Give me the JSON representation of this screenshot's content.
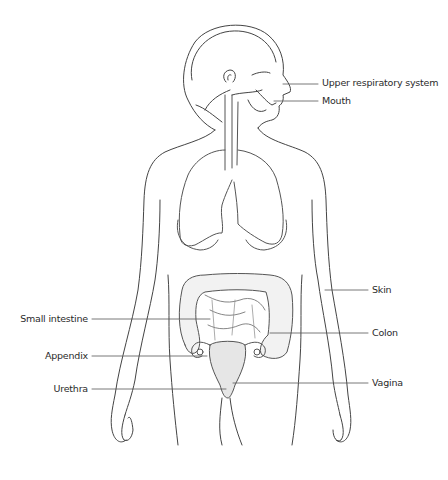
{
  "diagram": {
    "colors": {
      "outline": "#444444",
      "organ_outline": "#555555",
      "organ_fill": "#e6e6e6",
      "leader_line": "#555555",
      "label_text": "#2a2a2a",
      "background": "#ffffff"
    },
    "labels_right": [
      {
        "text": "Upper respiratory system",
        "y": 83
      },
      {
        "text": "Mouth",
        "y": 101
      },
      {
        "text": "Skin",
        "y": 290
      },
      {
        "text": "Colon",
        "y": 333
      },
      {
        "text": "Vagina",
        "y": 383
      }
    ],
    "labels_left": [
      {
        "text": "Small intestine",
        "y": 319
      },
      {
        "text": "Appendix",
        "y": 356
      },
      {
        "text": "Urethra",
        "y": 389
      }
    ]
  }
}
